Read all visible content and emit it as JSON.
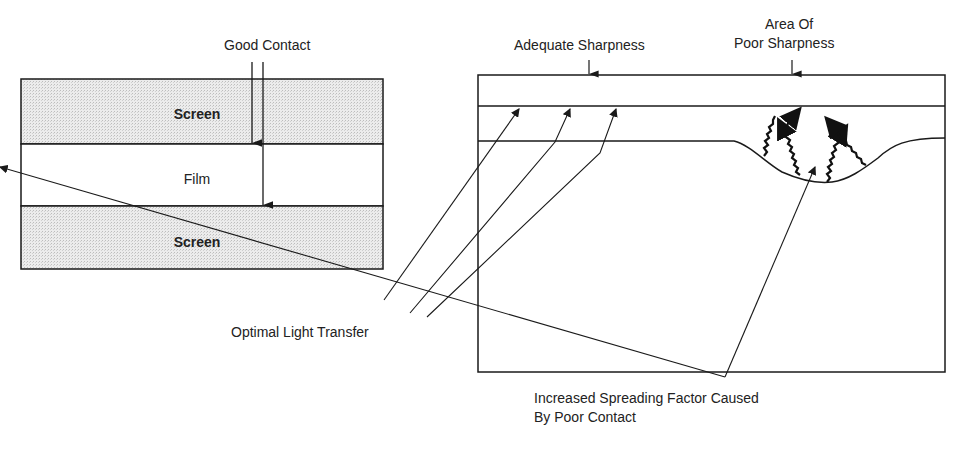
{
  "left_diagram": {
    "title_label": "Good Contact",
    "layers": [
      {
        "label": "Screen",
        "fill": "#e6e6e6"
      },
      {
        "label": "Film",
        "fill": "#ffffff"
      },
      {
        "label": "Screen",
        "fill": "#e6e6e6"
      }
    ]
  },
  "right_diagram": {
    "label_adequate": "Adequate Sharpness",
    "label_poor_line1": "Area Of",
    "label_poor_line2": "Poor Sharpness",
    "label_optimal": "Optimal Light Transfer",
    "label_spreading_line1": "Increased Spreading Factor Caused",
    "label_spreading_line2": "By Poor Contact"
  },
  "colors": {
    "line": "#1a1a1a",
    "screen_fill": "#e6e6e6"
  }
}
